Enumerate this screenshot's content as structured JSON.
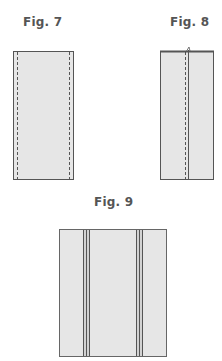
{
  "figures": [
    {
      "label": "Fig. 7",
      "description": "fabric strip with stitching lines along both long edges"
    },
    {
      "label": "Fig. 8",
      "description": "strip folded lengthwise with center stitching and fold line"
    },
    {
      "label": "Fig. 9",
      "description": "fabric panel with two vertical double seams"
    }
  ],
  "colors": {
    "fabric_fill": "#e6e6e6",
    "outline": "#555555",
    "stitch": "#444444"
  }
}
